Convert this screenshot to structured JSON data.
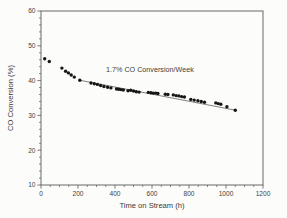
{
  "chart_data": {
    "type": "scatter",
    "title": "",
    "xlabel": "Time on Stream (h)",
    "ylabel": "CO Conversion (%)",
    "annotation": "1.7% CO Conversion/Week",
    "xlim": [
      0,
      1200
    ],
    "ylim": [
      10,
      60
    ],
    "x_major_ticks": [
      0,
      200,
      400,
      600,
      800,
      1000,
      1200
    ],
    "x_minor_step": 50,
    "y_major_ticks": [
      10,
      20,
      30,
      40,
      50,
      60
    ],
    "y_minor_step": 2,
    "grid": false,
    "legend": "none",
    "marker_shape": "filled-circle",
    "marker_color": "#161616",
    "axis_color": "#5a5a5a",
    "trend_line_color": "#4a4a4a",
    "trend_line": {
      "from": [
        210,
        40.1
      ],
      "to": [
        1050,
        31.5
      ]
    },
    "series": [
      {
        "name": "CO Conversion",
        "points": [
          [
            20,
            46.3
          ],
          [
            45,
            45.5
          ],
          [
            113,
            43.6
          ],
          [
            133,
            42.7
          ],
          [
            148,
            42.2
          ],
          [
            163,
            41.6
          ],
          [
            180,
            41.0
          ],
          [
            210,
            40.1
          ],
          [
            270,
            39.3
          ],
          [
            288,
            39.1
          ],
          [
            305,
            38.9
          ],
          [
            322,
            38.6
          ],
          [
            340,
            38.3
          ],
          [
            360,
            38.1
          ],
          [
            378,
            37.9
          ],
          [
            408,
            37.6
          ],
          [
            420,
            37.5
          ],
          [
            432,
            37.4
          ],
          [
            445,
            37.3
          ],
          [
            470,
            37.1
          ],
          [
            485,
            37.2
          ],
          [
            500,
            37.0
          ],
          [
            515,
            36.8
          ],
          [
            530,
            36.7
          ],
          [
            580,
            36.6
          ],
          [
            594,
            36.5
          ],
          [
            607,
            36.4
          ],
          [
            620,
            36.4
          ],
          [
            632,
            36.3
          ],
          [
            672,
            36.1
          ],
          [
            686,
            36.0
          ],
          [
            715,
            35.9
          ],
          [
            730,
            35.7
          ],
          [
            745,
            35.6
          ],
          [
            760,
            35.4
          ],
          [
            775,
            35.3
          ],
          [
            810,
            34.6
          ],
          [
            828,
            34.4
          ],
          [
            848,
            34.2
          ],
          [
            866,
            34.0
          ],
          [
            884,
            33.8
          ],
          [
            945,
            33.6
          ],
          [
            958,
            33.4
          ],
          [
            972,
            33.2
          ],
          [
            1005,
            32.5
          ],
          [
            1050,
            31.5
          ]
        ]
      }
    ]
  }
}
